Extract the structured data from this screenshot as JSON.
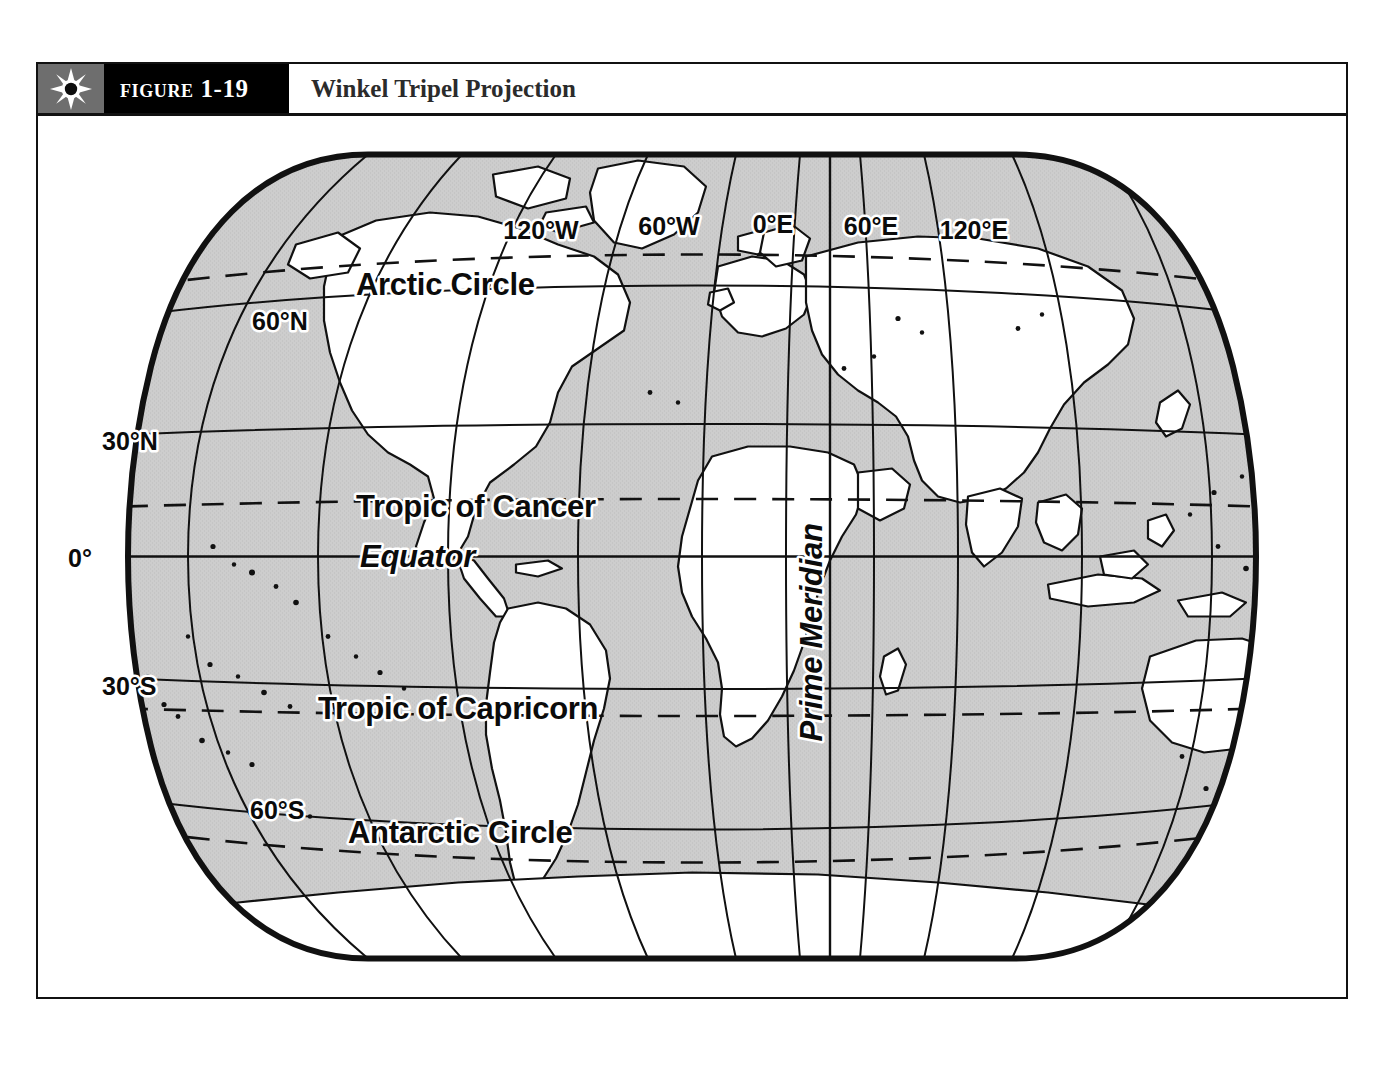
{
  "figure": {
    "icon": "sun-icon",
    "number_label": "Figure 1-19",
    "title": "Winkel Tripel Projection"
  },
  "colors": {
    "frame": "#111111",
    "header_number_bg": "#000000",
    "header_icon_bg": "#6e6e6e",
    "title_text": "#2b2b2b",
    "ocean": "#c9c9c9",
    "land": "#ffffff",
    "line": "#111111",
    "label_text": "#0b0b0b",
    "label_halo": "#ffffff"
  },
  "map": {
    "projection": "Winkel Tripel",
    "ocean_fill": "shaded-gray",
    "land_fill": "white",
    "longitude_labels": [
      {
        "text": "120°W",
        "x": 503,
        "y": 122
      },
      {
        "text": "60°W",
        "x": 631,
        "y": 118
      },
      {
        "text": "0°E",
        "x": 735,
        "y": 116
      },
      {
        "text": "60°E",
        "x": 833,
        "y": 118
      },
      {
        "text": "120°E",
        "x": 936,
        "y": 122
      }
    ],
    "latitude_labels": [
      {
        "text": "60°N",
        "x": 255,
        "y": 213
      },
      {
        "text": "30°N",
        "x": 105,
        "y": 355
      },
      {
        "text": "0°",
        "x": 42,
        "y": 507
      },
      {
        "text": "30°S",
        "x": 105,
        "y": 693
      },
      {
        "text": "60°S",
        "x": 253,
        "y": 827
      }
    ],
    "named_lines": [
      {
        "name": "Arctic Circle",
        "text": "Arctic Circle",
        "style": "upright",
        "x": 337,
        "y": 192
      },
      {
        "name": "Tropic of Cancer",
        "text": "Tropic of Cancer",
        "style": "upright",
        "x": 337,
        "y": 415
      },
      {
        "name": "Equator",
        "text": "Equator",
        "style": "italic",
        "x": 341,
        "y": 520
      },
      {
        "name": "Tropic of Capricorn",
        "text": "Tropic of Capricorn",
        "style": "upright",
        "x": 298,
        "y": 628
      },
      {
        "name": "Antarctic Circle",
        "text": "Antarctic Circle",
        "style": "upright",
        "x": 330,
        "y": 830
      },
      {
        "name": "Prime Meridian",
        "text": "Prime Meridian",
        "style": "italic-vertical",
        "x": 674,
        "y": 625
      }
    ],
    "graticule": {
      "meridian_interval_deg": 30,
      "parallel_interval_deg": 30,
      "dashed_lines": [
        "Tropic of Cancer",
        "Tropic of Capricorn",
        "Arctic Circle",
        "Antarctic Circle"
      ],
      "solid_lines": [
        "Equator",
        "30°N",
        "60°N",
        "30°S",
        "60°S",
        "Prime Meridian"
      ]
    }
  }
}
